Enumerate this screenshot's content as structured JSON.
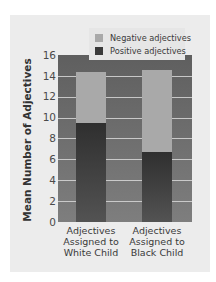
{
  "chart_data": {
    "type": "bar",
    "stacked": true,
    "title": "",
    "xlabel": "",
    "ylabel": "Mean Number of Adjectives",
    "ylim": [
      0,
      16
    ],
    "yticks": [
      0,
      2,
      4,
      6,
      8,
      10,
      12,
      14,
      16
    ],
    "grid": true,
    "legend_position": "top-right",
    "categories": [
      "Adjectives Assigned to White Child",
      "Adjectives Assigned to Black Child"
    ],
    "series": [
      {
        "name": "Positive adjectives",
        "color": "#3a3a3a",
        "values": [
          9.5,
          6.7
        ]
      },
      {
        "name": "Negative adjectives",
        "color": "#a9a9a9",
        "values": [
          4.9,
          7.9
        ]
      }
    ],
    "totals": [
      14.4,
      14.6
    ]
  },
  "axis": {
    "ylabel": "Mean Number of Adjectives",
    "ticks": [
      "0",
      "2",
      "4",
      "6",
      "8",
      "10",
      "12",
      "14",
      "16"
    ]
  },
  "legend": {
    "negative": "Negative adjectives",
    "positive": "Positive adjectives"
  },
  "xlabels": {
    "white": [
      "Adjectives",
      "Assigned to",
      "White Child"
    ],
    "black": [
      "Adjectives",
      "Assigned to",
      "Black Child"
    ]
  }
}
